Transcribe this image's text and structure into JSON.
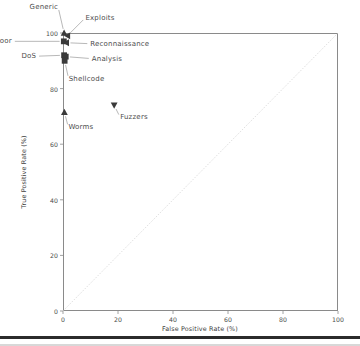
{
  "chart_data": {
    "type": "scatter",
    "title": "",
    "xlabel": "False Positive Rate (%)",
    "ylabel": "True Positive Rate (%)",
    "xlim": [
      0,
      100
    ],
    "ylim": [
      0,
      100
    ],
    "xticks": [
      "0",
      "20",
      "40",
      "60",
      "80",
      "100"
    ],
    "yticks": [
      "0",
      "20",
      "40",
      "60",
      "80",
      "100"
    ],
    "xtick_values": [
      0,
      20,
      40,
      60,
      80,
      100
    ],
    "ytick_values": [
      0,
      20,
      40,
      60,
      80,
      100
    ],
    "grid": false,
    "legend": "none",
    "marker_color": "#3a3a3a",
    "reference_line": {
      "name": "chance-diagonal",
      "from": [
        0,
        0
      ],
      "to": [
        100,
        100
      ],
      "style": "dotted",
      "color": "#c9c9c9"
    },
    "points": [
      {
        "label": "Generic",
        "x": 0.4,
        "y": 100.0,
        "marker": "triangle-up",
        "label_dx": -6,
        "label_dy": -26
      },
      {
        "label": "Exploits",
        "x": 1.6,
        "y": 99.0,
        "marker": "triangle-left",
        "label_dx": 18,
        "label_dy": -18
      },
      {
        "label": "Backdoor",
        "x": 0.3,
        "y": 97.0,
        "marker": "square",
        "label_dx": -52,
        "label_dy": 0
      },
      {
        "label": "Reconnaissance",
        "x": 1.2,
        "y": 96.5,
        "marker": "triangle-left",
        "label_dx": 24,
        "label_dy": 1
      },
      {
        "label": "DoS",
        "x": 0.4,
        "y": 92.0,
        "marker": "square",
        "label_dx": -28,
        "label_dy": 1
      },
      {
        "label": "Analysis",
        "x": 1.0,
        "y": 91.5,
        "marker": "square",
        "label_dx": 26,
        "label_dy": 2
      },
      {
        "label": "Shellcode",
        "x": 0.6,
        "y": 90.0,
        "marker": "square",
        "label_dx": 4,
        "label_dy": 18
      },
      {
        "label": "Worms",
        "x": 0.5,
        "y": 71.5,
        "marker": "triangle-up",
        "label_dx": 4,
        "label_dy": 15
      },
      {
        "label": "Fuzzers",
        "x": 18.6,
        "y": 74.0,
        "marker": "triangle-down",
        "label_dx": 6,
        "label_dy": 12
      }
    ]
  }
}
